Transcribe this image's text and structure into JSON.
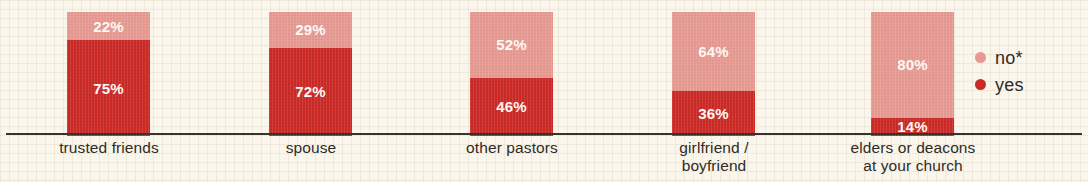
{
  "chart_data": {
    "type": "bar",
    "subtype": "stacked-100",
    "title": "",
    "subtitle": "",
    "xlabel": "",
    "ylabel": "",
    "ylim": [
      0,
      100
    ],
    "grid": false,
    "legend_position": "right",
    "categories": [
      "trusted friends",
      "spouse",
      "other pastors",
      "girlfriend /\nboyfriend",
      "elders or deacons\nat your church"
    ],
    "series": [
      {
        "name": "no*",
        "color": "#e69a92",
        "values": [
          22,
          29,
          52,
          64,
          80
        ]
      },
      {
        "name": "yes",
        "color": "#cc2a26",
        "values": [
          75,
          72,
          46,
          36,
          14
        ]
      }
    ],
    "value_labels": {
      "no": [
        "22%",
        "29%",
        "52%",
        "64%",
        "80%"
      ],
      "yes": [
        "75%",
        "72%",
        "46%",
        "36%",
        "14%"
      ]
    }
  },
  "bars": [
    {
      "category_line1": "trusted friends",
      "category_line2": "",
      "no_label": "22%",
      "yes_label": "75%",
      "no_value": 22,
      "yes_value": 75
    },
    {
      "category_line1": "spouse",
      "category_line2": "",
      "no_label": "29%",
      "yes_label": "72%",
      "no_value": 29,
      "yes_value": 72
    },
    {
      "category_line1": "other pastors",
      "category_line2": "",
      "no_label": "52%",
      "yes_label": "46%",
      "no_value": 52,
      "yes_value": 46
    },
    {
      "category_line1": "girlfriend /",
      "category_line2": "boyfriend",
      "no_label": "64%",
      "yes_label": "36%",
      "no_value": 64,
      "yes_value": 36
    },
    {
      "category_line1": "elders or deacons",
      "category_line2": "at your church",
      "no_label": "80%",
      "yes_label": "14%",
      "no_value": 80,
      "yes_value": 14
    }
  ],
  "legend": {
    "items": [
      {
        "label": "no*",
        "color": "#e69a92"
      },
      {
        "label": "yes",
        "color": "#cc2a26"
      }
    ]
  },
  "colors": {
    "background": "#faf6ec",
    "axis": "#3a332c",
    "no": "#e69a92",
    "yes": "#cc2a26",
    "value_text": "#fdf8f2",
    "category_text": "#2f2b27"
  }
}
